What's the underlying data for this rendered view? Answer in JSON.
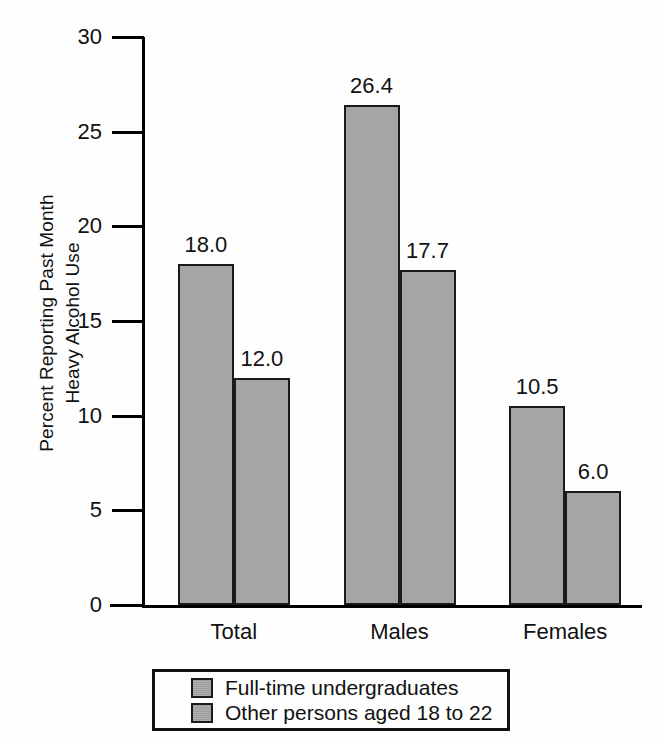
{
  "chart_data": {
    "type": "bar",
    "title": "",
    "subtitle": "",
    "xlabel": "",
    "ylabel": "Percent Reporting Past Month\nHeavy Alcohol Use",
    "ylim": [
      0,
      30
    ],
    "yticks": [
      0,
      5,
      10,
      15,
      20,
      25,
      30
    ],
    "ytick_labels": [
      "0",
      "5",
      "10",
      "15",
      "20",
      "25",
      "30"
    ],
    "grid": false,
    "legend_position": "bottom",
    "categories": [
      "Total",
      "Males",
      "Females"
    ],
    "series": [
      {
        "name": "Full-time undergraduates",
        "values": [
          18.0,
          26.4,
          10.5
        ],
        "labels": [
          "18.0",
          "26.4",
          "10.5"
        ],
        "color": "#a5a5a5"
      },
      {
        "name": "Other persons aged 18 to 22",
        "values": [
          12.0,
          17.7,
          6.0
        ],
        "labels": [
          "12.0",
          "17.7",
          "6.0"
        ],
        "color": "#a5a5a5"
      }
    ]
  },
  "legend": {
    "entries": [
      {
        "label": "Full-time undergraduates"
      },
      {
        "label": "Other persons aged 18 to 22"
      }
    ]
  },
  "colors": {
    "bar_fill": "#a5a5a5",
    "bar_stroke": "#1a1a1a",
    "axis": "#000000",
    "text": "#111111",
    "background": "#fefefe"
  }
}
